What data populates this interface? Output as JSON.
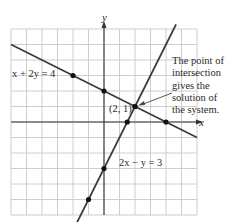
{
  "chart_data": {
    "type": "line",
    "title": "",
    "xlabel": "x",
    "ylabel": "y",
    "xlim": [
      -6,
      6
    ],
    "ylim": [
      -6,
      6
    ],
    "grid": true,
    "series": [
      {
        "name": "x + 2y = 4",
        "label": "x + 2y = 4",
        "slope": -0.5,
        "intercept": 2,
        "points": [
          [
            -2,
            3
          ],
          [
            0,
            2
          ],
          [
            2,
            1
          ],
          [
            4,
            0
          ]
        ],
        "color": "#3a3a3a"
      },
      {
        "name": "2x − y = 3",
        "label": "2x − y = 3",
        "slope": 2,
        "intercept": -3,
        "points": [
          [
            -1,
            -5
          ],
          [
            0,
            -3
          ],
          [
            1.5,
            0
          ],
          [
            2,
            1
          ]
        ],
        "color": "#3a3a3a"
      }
    ],
    "intersection": {
      "x": 2,
      "y": 1,
      "label": "(2, 1)"
    },
    "annotation": {
      "lines": [
        "The point of",
        "intersection",
        "gives the",
        "solution of",
        "the system."
      ],
      "points_to": [
        2,
        1
      ]
    }
  }
}
